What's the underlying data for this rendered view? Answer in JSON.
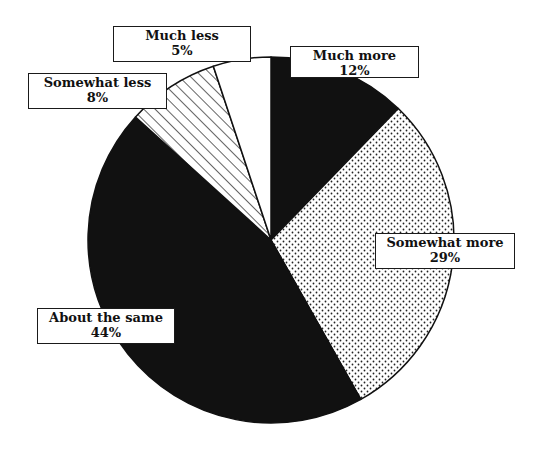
{
  "chart_data": {
    "type": "pie",
    "title": "",
    "categories": [
      "Much more",
      "Somewhat more",
      "About the same",
      "Somewhat less",
      "Much less"
    ],
    "values": [
      12,
      29,
      44,
      8,
      5
    ],
    "unit": "%",
    "start_angle": "12 o'clock",
    "direction": "clockwise",
    "legend": "none (direct labels)",
    "slices": [
      {
        "label": "Much more",
        "value": 12,
        "display": "12%",
        "fill": "solid-black"
      },
      {
        "label": "Somewhat more",
        "value": 29,
        "display": "29%",
        "fill": "dotted"
      },
      {
        "label": "About the same",
        "value": 44,
        "display": "44%",
        "fill": "solid-black"
      },
      {
        "label": "Somewhat less",
        "value": 8,
        "display": "8%",
        "fill": "diagonal-hatch"
      },
      {
        "label": "Much less",
        "value": 5,
        "display": "5%",
        "fill": "white"
      }
    ]
  },
  "colors": {
    "ink": "#111111",
    "paper": "#ffffff"
  }
}
